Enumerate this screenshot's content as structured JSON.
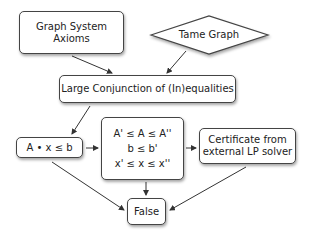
{
  "nodes": {
    "axioms": {
      "lines": [
        "Graph System",
        "Axioms"
      ]
    },
    "tame_graph": {
      "label": "Tame Graph",
      "shape": "diamond"
    },
    "conjunction": {
      "label": "Large Conjunction of (In)equalities"
    },
    "linear_system": {
      "label": "A • x ≤ b"
    },
    "bounds": {
      "lines": [
        "A' ≤ A ≤ A''",
        "b ≤ b'",
        "x' ≤ x ≤ x''"
      ]
    },
    "certificate": {
      "lines": [
        "Certificate from",
        "external LP solver"
      ]
    },
    "false": {
      "label": "False"
    }
  },
  "edges": [
    {
      "from": "axioms",
      "to": "conjunction"
    },
    {
      "from": "tame_graph",
      "to": "conjunction"
    },
    {
      "from": "conjunction",
      "to": "linear_system"
    },
    {
      "from": "linear_system",
      "to": "bounds"
    },
    {
      "from": "bounds",
      "to": "certificate"
    },
    {
      "from": "linear_system",
      "to": "false"
    },
    {
      "from": "bounds",
      "to": "false"
    },
    {
      "from": "certificate",
      "to": "false"
    }
  ],
  "colors": {
    "stroke": "#444444",
    "fill": "#ffffff",
    "text": "#222222"
  }
}
